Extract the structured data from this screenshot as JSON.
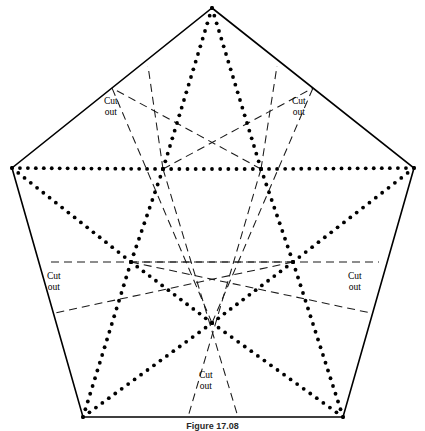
{
  "figure": {
    "caption": "Figure 17.08",
    "background_color": "#ffffff",
    "ink_color": "#000000",
    "solid_line_color": "#000000",
    "dashed_line_color": "#1a1a1a",
    "dotted_line_color": "#000000",
    "canvas": {
      "width": 425,
      "height": 431
    }
  },
  "labels": {
    "cut_out_line1": "Cut",
    "cut_out_line2": "out",
    "placements": [
      {
        "id": "cut-out-top-left",
        "x": 104,
        "y": 96
      },
      {
        "id": "cut-out-top-right",
        "x": 292,
        "y": 96
      },
      {
        "id": "cut-out-left",
        "x": 47,
        "y": 271
      },
      {
        "id": "cut-out-right",
        "x": 348,
        "y": 271
      },
      {
        "id": "cut-out-bottom",
        "x": 199,
        "y": 370
      }
    ]
  },
  "geometry": {
    "outer_pentagon": {
      "name": "outer-pentagon",
      "stroke": "#000000",
      "stroke_width": 1.6,
      "style": "solid",
      "vertices": [
        {
          "id": "top",
          "x": 212,
          "y": 8
        },
        {
          "id": "right",
          "x": 414,
          "y": 168
        },
        {
          "id": "bottom-right",
          "x": 343,
          "y": 417
        },
        {
          "id": "bottom-left",
          "x": 83,
          "y": 417
        },
        {
          "id": "left",
          "x": 12,
          "y": 168
        }
      ]
    },
    "inner_pentagon": {
      "name": "inner-pentagon",
      "stroke": "#000000",
      "style": "dotted",
      "dot_radius": 1.9,
      "dot_spacing": 8,
      "vertices": [
        {
          "id": "inner-top-left",
          "x": 163,
          "y": 169
        },
        {
          "id": "inner-top-right",
          "x": 261,
          "y": 169
        },
        {
          "id": "inner-right",
          "x": 293,
          "y": 262
        },
        {
          "id": "inner-bottom",
          "x": 212,
          "y": 323
        },
        {
          "id": "inner-left",
          "x": 131,
          "y": 262
        }
      ]
    },
    "dotted_segments": [
      {
        "id": "inner-edge-tl-tr",
        "from": [
          163,
          169
        ],
        "to": [
          261,
          169
        ]
      },
      {
        "id": "inner-edge-tr-r",
        "from": [
          261,
          169
        ],
        "to": [
          293,
          262
        ]
      },
      {
        "id": "inner-edge-r-b",
        "from": [
          293,
          262
        ],
        "to": [
          212,
          323
        ]
      },
      {
        "id": "inner-edge-b-l",
        "from": [
          212,
          323
        ],
        "to": [
          131,
          262
        ]
      },
      {
        "id": "inner-edge-l-tl",
        "from": [
          131,
          262
        ],
        "to": [
          163,
          169
        ]
      },
      {
        "id": "ray-tl-to-top",
        "from": [
          163,
          169
        ],
        "to": [
          212,
          8
        ]
      },
      {
        "id": "ray-tr-to-top",
        "from": [
          261,
          169
        ],
        "to": [
          212,
          8
        ]
      },
      {
        "id": "ray-tr-to-right",
        "from": [
          261,
          169
        ],
        "to": [
          414,
          168
        ]
      },
      {
        "id": "ray-r-to-right",
        "from": [
          293,
          262
        ],
        "to": [
          414,
          168
        ]
      },
      {
        "id": "ray-r-to-br",
        "from": [
          293,
          262
        ],
        "to": [
          343,
          417
        ]
      },
      {
        "id": "ray-b-to-br",
        "from": [
          212,
          323
        ],
        "to": [
          343,
          417
        ]
      },
      {
        "id": "ray-b-to-bl",
        "from": [
          212,
          323
        ],
        "to": [
          83,
          417
        ]
      },
      {
        "id": "ray-l-to-bl",
        "from": [
          131,
          262
        ],
        "to": [
          83,
          417
        ]
      },
      {
        "id": "ray-l-to-left",
        "from": [
          131,
          262
        ],
        "to": [
          12,
          168
        ]
      },
      {
        "id": "ray-tl-to-left",
        "from": [
          163,
          169
        ],
        "to": [
          12,
          168
        ]
      }
    ],
    "dashed_segments": [
      {
        "id": "dash-tl-to-edge-tr",
        "from": [
          163,
          169
        ],
        "to": [
          313,
          88
        ]
      },
      {
        "id": "dash-tr-to-edge-tl",
        "from": [
          261,
          169
        ],
        "to": [
          112,
          88
        ]
      },
      {
        "id": "dash-tl-to-bottom-edge",
        "from": [
          163,
          169
        ],
        "to": [
          238,
          417
        ]
      },
      {
        "id": "dash-tr-to-bottom-edge",
        "from": [
          261,
          169
        ],
        "to": [
          188,
          417
        ]
      },
      {
        "id": "dash-l-to-right-edge",
        "from": [
          131,
          262
        ],
        "to": [
          379,
          262
        ]
      },
      {
        "id": "dash-r-to-left-edge",
        "from": [
          293,
          262
        ],
        "to": [
          46,
          262
        ]
      },
      {
        "id": "dash-l-to-edge-lowerright",
        "from": [
          131,
          262
        ],
        "to": [
          371,
          313
        ]
      },
      {
        "id": "dash-r-to-edge-lowerleft",
        "from": [
          293,
          262
        ],
        "to": [
          55,
          313
        ]
      },
      {
        "id": "dash-b-to-top-left-edge",
        "from": [
          212,
          323
        ],
        "to": [
          112,
          88
        ]
      },
      {
        "id": "dash-b-to-top-right-edge",
        "from": [
          212,
          323
        ],
        "to": [
          313,
          88
        ]
      },
      {
        "id": "dash-tl-up-left",
        "from": [
          163,
          169
        ],
        "to": [
          148,
          66
        ]
      },
      {
        "id": "dash-tr-up-right",
        "from": [
          261,
          169
        ],
        "to": [
          277,
          66
        ]
      }
    ]
  }
}
